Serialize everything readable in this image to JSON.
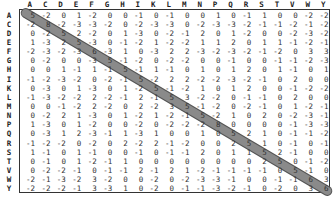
{
  "matrix": {
    "labels": [
      "A",
      "C",
      "D",
      "E",
      "F",
      "G",
      "H",
      "I",
      "K",
      "L",
      "M",
      "N",
      "P",
      "Q",
      "R",
      "S",
      "T",
      "V",
      "W",
      "Y"
    ],
    "diagonal_highlight_color": "#8a8a8a",
    "values": [
      [
        5,
        -2,
        0,
        1,
        -2,
        0,
        0,
        -1,
        0,
        -1,
        0,
        0,
        1,
        0,
        -1,
        1,
        0,
        0,
        -2,
        -2
      ],
      [
        -2,
        8,
        -2,
        -3,
        -3,
        -2,
        0,
        -2,
        -3,
        -3,
        0,
        -2,
        -3,
        -3,
        -2,
        -1,
        -1,
        -2,
        -1,
        -2
      ],
      [
        0,
        -2,
        5,
        2,
        -2,
        0,
        1,
        -3,
        0,
        -2,
        -1,
        2,
        0,
        1,
        -2,
        0,
        0,
        -2,
        -3,
        -2
      ],
      [
        1,
        -3,
        2,
        5,
        -3,
        0,
        -1,
        -2,
        1,
        -2,
        -2,
        1,
        1,
        2,
        0,
        1,
        1,
        -1,
        -2,
        -1
      ],
      [
        -2,
        -3,
        -2,
        -3,
        6,
        -3,
        1,
        0,
        -3,
        2,
        2,
        -3,
        -2,
        -3,
        -2,
        -1,
        -2,
        0,
        3,
        3
      ],
      [
        0,
        -2,
        0,
        0,
        -3,
        5,
        -1,
        -2,
        0,
        -2,
        -2,
        0,
        0,
        -1,
        0,
        0,
        -1,
        -1,
        -2,
        -3
      ],
      [
        0,
        0,
        1,
        -1,
        1,
        -1,
        5,
        -1,
        1,
        -1,
        0,
        1,
        0,
        1,
        2,
        0,
        1,
        -1,
        0,
        1
      ],
      [
        -1,
        -2,
        -3,
        -2,
        0,
        -2,
        -1,
        5,
        -2,
        2,
        2,
        -2,
        -2,
        -3,
        -2,
        -1,
        0,
        2,
        0,
        0
      ],
      [
        0,
        -3,
        0,
        1,
        -3,
        0,
        1,
        -2,
        5,
        -1,
        -2,
        1,
        0,
        1,
        2,
        0,
        0,
        -1,
        -2,
        -2
      ],
      [
        -1,
        -3,
        -2,
        -2,
        2,
        -2,
        -1,
        2,
        -1,
        5,
        3,
        -2,
        -2,
        0,
        -1,
        -1,
        0,
        2,
        0,
        0
      ],
      [
        0,
        0,
        -1,
        -2,
        2,
        -2,
        0,
        2,
        -2,
        3,
        5,
        -1,
        -2,
        0,
        -2,
        -1,
        0,
        1,
        -2,
        -1
      ],
      [
        0,
        -2,
        2,
        1,
        -3,
        0,
        1,
        -2,
        1,
        -2,
        -1,
        5,
        -2,
        1,
        0,
        2,
        0,
        -2,
        -3,
        -1
      ],
      [
        1,
        -3,
        0,
        1,
        -2,
        0,
        0,
        -2,
        0,
        -2,
        -2,
        -2,
        8,
        0,
        0,
        0,
        0,
        -1,
        -3,
        -3
      ],
      [
        0,
        -3,
        1,
        2,
        -3,
        -1,
        1,
        -3,
        1,
        0,
        0,
        1,
        0,
        5,
        2,
        1,
        0,
        -1,
        -1,
        -2
      ],
      [
        -1,
        -2,
        -2,
        0,
        -2,
        0,
        2,
        -2,
        2,
        -1,
        -2,
        0,
        0,
        2,
        5,
        1,
        0,
        -1,
        0,
        -1
      ],
      [
        1,
        -1,
        0,
        1,
        -1,
        0,
        0,
        -1,
        0,
        -1,
        -1,
        2,
        0,
        1,
        1,
        5,
        2,
        -1,
        0,
        0
      ],
      [
        0,
        -1,
        0,
        1,
        -2,
        -1,
        1,
        0,
        0,
        0,
        0,
        0,
        0,
        0,
        0,
        2,
        5,
        0,
        -1,
        -2
      ],
      [
        0,
        -2,
        -2,
        -1,
        0,
        -1,
        -1,
        2,
        -1,
        2,
        1,
        -2,
        -1,
        -1,
        -1,
        -1,
        0,
        5,
        -1,
        0
      ],
      [
        -2,
        -1,
        -3,
        -2,
        3,
        -2,
        0,
        0,
        -2,
        0,
        -2,
        -3,
        -3,
        -1,
        0,
        0,
        -1,
        -1,
        6,
        3
      ],
      [
        -2,
        -2,
        -2,
        -1,
        3,
        -3,
        1,
        0,
        -2,
        0,
        -1,
        -1,
        -3,
        -2,
        -1,
        0,
        -2,
        0,
        3,
        6
      ]
    ]
  }
}
